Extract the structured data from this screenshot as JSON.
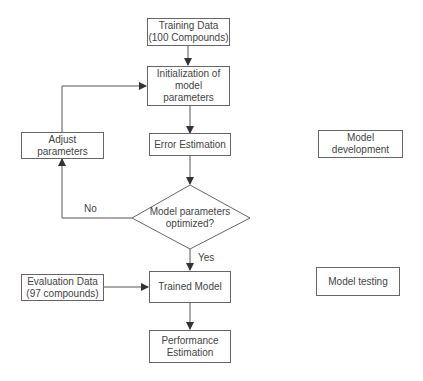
{
  "diagram": {
    "type": "flowchart",
    "nodes": {
      "training_data": "Training Data\n(100 Compounds)",
      "init_params": "Initialization of\nmodel\nparameters",
      "error_estimation": "Error Estimation",
      "adjust_params": "Adjust parameters",
      "decision": "Model parameters\noptimized?",
      "evaluation_data": "Evaluation Data\n(97 compounds)",
      "trained_model": "Trained Model",
      "performance": "Performance\nEstimation",
      "phase_development": "Model development",
      "phase_testing": "Model testing"
    },
    "edge_labels": {
      "no": "No",
      "yes": "Yes"
    },
    "edges": [
      {
        "from": "training_data",
        "to": "init_params"
      },
      {
        "from": "init_params",
        "to": "error_estimation"
      },
      {
        "from": "error_estimation",
        "to": "decision"
      },
      {
        "from": "decision",
        "to": "adjust_params",
        "label": "No"
      },
      {
        "from": "adjust_params",
        "to": "init_params"
      },
      {
        "from": "decision",
        "to": "trained_model",
        "label": "Yes"
      },
      {
        "from": "evaluation_data",
        "to": "trained_model"
      },
      {
        "from": "trained_model",
        "to": "performance"
      }
    ],
    "colors": {
      "line": "#555555",
      "text": "#444444",
      "background": "#ffffff"
    }
  }
}
